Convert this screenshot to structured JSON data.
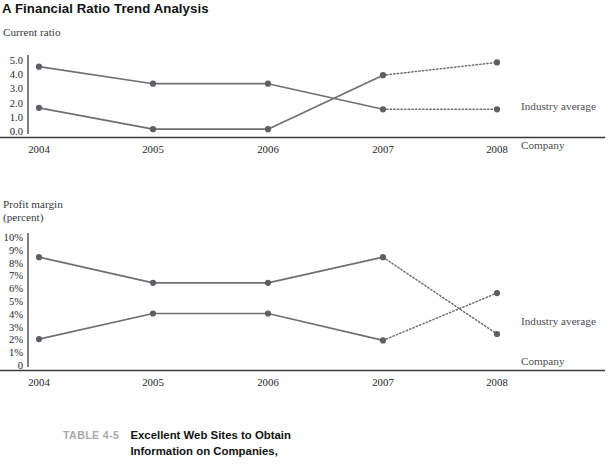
{
  "figure": {
    "title": "A Financial Ratio Trend Analysis"
  },
  "chart1": {
    "axis_caption": "Current ratio",
    "series_labels": {
      "industry_average": "Industry average",
      "company": "Company"
    }
  },
  "chart2": {
    "axis_caption_line1": "Profit margin",
    "axis_caption_line2": "(percent)",
    "series_labels": {
      "industry_average": "Industry average",
      "company": "Company"
    }
  },
  "table_caption": {
    "number": "TABLE 4-5",
    "title_line1": "Excellent Web Sites to Obtain",
    "title_line2": "Information on Companies,"
  },
  "colors": {
    "line": "#6f6f75",
    "marker": "#5e5e64",
    "axis": "#3a3a3f",
    "tick_text": "#26262b",
    "series_label_text": "#4d4d53",
    "title_text": "#111114",
    "caption_number": "#a8a8ad",
    "background": "#ffffff"
  },
  "chart_data": [
    {
      "type": "line",
      "title": "Current ratio",
      "xlabel": "",
      "ylabel": "Current ratio",
      "x": [
        "2004",
        "2005",
        "2006",
        "2007",
        "2008"
      ],
      "categories": [
        "2004",
        "2005",
        "2006",
        "2007",
        "2008"
      ],
      "yticks": [
        "5.0",
        "4.0",
        "3.0",
        "2.0",
        "1.0",
        "0.0"
      ],
      "ytick_values": [
        5.0,
        4.0,
        3.0,
        2.0,
        1.0,
        0.0
      ],
      "ylim": [
        0.0,
        5.0
      ],
      "grid": false,
      "legend_position": "right-of-endpoints",
      "series": [
        {
          "name": "Company",
          "label_at_end": "Company",
          "values": [
            4.6,
            3.4,
            3.4,
            1.6,
            1.6
          ],
          "solid_through_index": 3,
          "dashed_from_index": 3
        },
        {
          "name": "Industry average",
          "label_at_end": "Industry average",
          "values": [
            1.7,
            0.2,
            0.2,
            4.0,
            4.9
          ],
          "solid_through_index": 3,
          "dashed_from_index": 3
        }
      ],
      "notes": "Solid lines show 2004-2007 actuals; dotted segments show 2007-2008 projections. The two series cross between 2006 and 2007."
    },
    {
      "type": "line",
      "title": "Profit margin (percent)",
      "xlabel": "",
      "ylabel": "Profit margin (percent)",
      "x": [
        "2004",
        "2005",
        "2006",
        "2007",
        "2008"
      ],
      "categories": [
        "2004",
        "2005",
        "2006",
        "2007",
        "2008"
      ],
      "yticks": [
        "10%",
        "9%",
        "8%",
        "7%",
        "6%",
        "5%",
        "4%",
        "3%",
        "2%",
        "1%",
        "0"
      ],
      "ytick_values": [
        10,
        9,
        8,
        7,
        6,
        5,
        4,
        3,
        2,
        1,
        0
      ],
      "ylim": [
        0,
        10
      ],
      "grid": false,
      "legend_position": "right-of-endpoints",
      "series": [
        {
          "name": "Company",
          "label_at_end": "Company",
          "values": [
            8.5,
            6.5,
            6.5,
            8.5,
            2.5
          ],
          "solid_through_index": 3,
          "dashed_from_index": 3
        },
        {
          "name": "Industry average",
          "label_at_end": "Industry average",
          "values": [
            2.1,
            4.1,
            4.1,
            2.0,
            5.7
          ],
          "solid_through_index": 3,
          "dashed_from_index": 3
        }
      ],
      "notes": "Solid lines show 2004-2007 actuals; dotted segments show 2007-2008 projections. The two dotted projection segments cross between 2007 and 2008."
    }
  ]
}
